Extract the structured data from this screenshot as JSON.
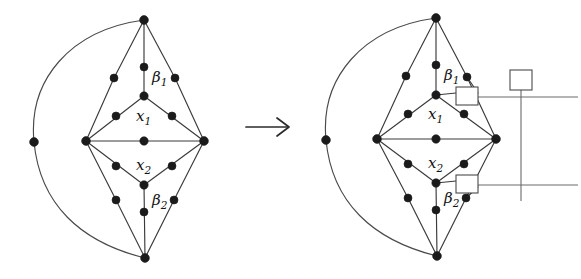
{
  "figure": {
    "transform_symbol": "⟶",
    "panels": [
      {
        "id": "left-graph",
        "name": "source-graph",
        "labels": [
          {
            "name": "label-beta-1",
            "base": "β",
            "sub": "1",
            "x": 152,
            "y": 82
          },
          {
            "name": "label-x-1",
            "base": "x",
            "sub": "1",
            "x": 136,
            "y": 121
          },
          {
            "name": "label-x-2",
            "base": "x",
            "sub": "2",
            "x": 136,
            "y": 170
          },
          {
            "name": "label-beta-2",
            "base": "β",
            "sub": "2",
            "x": 152,
            "y": 205
          }
        ],
        "vertices": [
          {
            "name": "vertex-top-apex",
            "x": 144,
            "y": 20,
            "r": 4.4
          },
          {
            "name": "vertex-upper-mid-stem",
            "x": 144,
            "y": 67,
            "r": 4.0
          },
          {
            "name": "vertex-upper-left-outer",
            "x": 114,
            "y": 78,
            "r": 4.0
          },
          {
            "name": "vertex-upper-right-outer",
            "x": 175,
            "y": 78,
            "r": 4.0
          },
          {
            "name": "vertex-x1-top",
            "x": 144,
            "y": 96,
            "r": 4.2
          },
          {
            "name": "vertex-x1-left",
            "x": 116,
            "y": 116,
            "r": 4.0
          },
          {
            "name": "vertex-x1-right",
            "x": 172,
            "y": 116,
            "r": 4.0
          },
          {
            "name": "vertex-mid-left",
            "x": 86,
            "y": 141,
            "r": 4.4
          },
          {
            "name": "vertex-mid-center",
            "x": 144,
            "y": 141,
            "r": 4.2
          },
          {
            "name": "vertex-mid-right",
            "x": 204,
            "y": 141,
            "r": 4.4
          },
          {
            "name": "vertex-x2-left",
            "x": 116,
            "y": 166,
            "r": 4.0
          },
          {
            "name": "vertex-x2-right",
            "x": 172,
            "y": 166,
            "r": 4.0
          },
          {
            "name": "vertex-x2-bottom",
            "x": 144,
            "y": 185,
            "r": 4.2
          },
          {
            "name": "vertex-lower-left-outer",
            "x": 116,
            "y": 200,
            "r": 4.0
          },
          {
            "name": "vertex-lower-right-outer",
            "x": 174,
            "y": 200,
            "r": 4.0
          },
          {
            "name": "vertex-lower-mid-stem",
            "x": 144,
            "y": 212,
            "r": 4.0
          },
          {
            "name": "vertex-bottom-apex",
            "x": 145,
            "y": 258,
            "r": 4.4
          },
          {
            "name": "vertex-arc-left",
            "x": 34,
            "y": 142,
            "r": 4.4
          }
        ],
        "edges": [
          "top-apex to upper-mid-stem",
          "upper-mid-stem to x1-top",
          "top-apex to upper-left-outer",
          "upper-left-outer to mid-left",
          "top-apex to upper-right-outer",
          "upper-right-outer to mid-right",
          "x1-top to x1-left",
          "x1-left to mid-left",
          "x1-top to x1-right",
          "x1-right to mid-right",
          "mid-left to mid-center",
          "mid-center to mid-right",
          "mid-left to x2-left",
          "x2-left to x2-bottom",
          "mid-right to x2-right",
          "x2-right to x2-bottom",
          "x2-bottom to lower-mid-stem",
          "lower-mid-stem to bottom-apex",
          "mid-left to lower-left-outer",
          "lower-left-outer to bottom-apex",
          "mid-right to lower-right-outer",
          "lower-right-outer to bottom-apex",
          "top-apex arc through arc-left to bottom-apex"
        ]
      },
      {
        "id": "right-graph",
        "name": "target-graph",
        "labels": [
          {
            "name": "label-beta-1",
            "base": "β",
            "sub": "1",
            "x": 444,
            "y": 80
          },
          {
            "name": "label-x-1",
            "base": "x",
            "sub": "1",
            "x": 428,
            "y": 119
          },
          {
            "name": "label-x-2",
            "base": "x",
            "sub": "2",
            "x": 428,
            "y": 168
          },
          {
            "name": "label-beta-2",
            "base": "β",
            "sub": "2",
            "x": 444,
            "y": 203
          }
        ],
        "vertices": [
          {
            "name": "vertex-top-apex",
            "x": 436,
            "y": 18,
            "r": 4.4
          },
          {
            "name": "vertex-upper-mid-stem",
            "x": 436,
            "y": 65,
            "r": 4.0
          },
          {
            "name": "vertex-upper-left-outer",
            "x": 406,
            "y": 76,
            "r": 4.0
          },
          {
            "name": "vertex-upper-right-outer",
            "x": 467,
            "y": 77,
            "r": 4.0
          },
          {
            "name": "vertex-x1-top",
            "x": 436,
            "y": 95,
            "r": 4.2
          },
          {
            "name": "vertex-x1-left",
            "x": 408,
            "y": 114,
            "r": 4.0
          },
          {
            "name": "vertex-x1-right",
            "x": 464,
            "y": 114,
            "r": 4.0
          },
          {
            "name": "vertex-mid-left",
            "x": 377,
            "y": 139,
            "r": 4.4
          },
          {
            "name": "vertex-mid-center",
            "x": 436,
            "y": 139,
            "r": 4.2
          },
          {
            "name": "vertex-mid-right",
            "x": 496,
            "y": 139,
            "r": 4.4
          },
          {
            "name": "vertex-x2-left",
            "x": 408,
            "y": 164,
            "r": 4.0
          },
          {
            "name": "vertex-x2-right",
            "x": 464,
            "y": 164,
            "r": 4.0
          },
          {
            "name": "vertex-x2-bottom",
            "x": 436,
            "y": 183,
            "r": 4.2
          },
          {
            "name": "vertex-lower-left-outer",
            "x": 408,
            "y": 198,
            "r": 4.0
          },
          {
            "name": "vertex-lower-right-outer",
            "x": 466,
            "y": 198,
            "r": 4.0
          },
          {
            "name": "vertex-lower-mid-stem",
            "x": 436,
            "y": 210,
            "r": 4.0
          },
          {
            "name": "vertex-bottom-apex",
            "x": 437,
            "y": 256,
            "r": 4.4
          },
          {
            "name": "vertex-arc-left",
            "x": 326,
            "y": 140,
            "r": 4.4
          }
        ],
        "boxes": [
          {
            "name": "box-beta-1-attachment",
            "x": 456,
            "y": 87,
            "w": 22,
            "h": 18
          },
          {
            "name": "box-beta-2-attachment",
            "x": 456,
            "y": 175,
            "w": 22,
            "h": 18
          },
          {
            "name": "box-root-top",
            "x": 510,
            "y": 70,
            "w": 22,
            "h": 20
          }
        ],
        "attachments": [
          {
            "name": "attachment-line-upper",
            "x1": 478,
            "y1": 97,
            "x2": 578,
            "y2": 97
          },
          {
            "name": "attachment-line-lower",
            "x1": 478,
            "y1": 185,
            "x2": 578,
            "y2": 185
          },
          {
            "name": "attachment-line-vertical",
            "x1": 521,
            "y1": 90,
            "x2": 521,
            "y2": 201
          }
        ]
      }
    ],
    "arrow": {
      "name": "transform-arrow",
      "x": 246,
      "y": 127,
      "length": 44
    }
  }
}
